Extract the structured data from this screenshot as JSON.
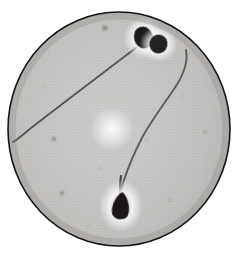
{
  "figure": {
    "kind": "photomicrograph",
    "caption": "",
    "medium": "halftone printed photomicrograph",
    "specimen": "spermatozoa smear",
    "field_shape": "circular microscope field of view",
    "background_color": "#ffffff"
  },
  "field": {
    "name": "microscope-field",
    "center_x": 119,
    "center_y": 129,
    "radius_x": 111,
    "radius_y": 117,
    "fill_color": "#c9c7c5",
    "rim_color": "#141414",
    "rim_width": 1.6,
    "texture": "fine halftone grid",
    "texture_color": "#9b9a98",
    "texture_pitch": 3
  },
  "illumination": {
    "name": "bright-spot-highlight",
    "x": 112,
    "y": 129,
    "radius": 22,
    "color": "#fdfdfd",
    "label": "condenser bright spot"
  },
  "vignette": {
    "name": "field-vignette",
    "inner_color": "#d4d2d0",
    "outer_color": "#a9a7a5"
  },
  "cells": [
    {
      "name": "sperm-upper-left",
      "label": "Spermatozoon A",
      "head": {
        "cx": 143.5,
        "cy": 37.5,
        "rx": 9.5,
        "ry": 11.0,
        "rotation": -18,
        "color": "#1d1b1a",
        "halo_color": "#f4f3f2",
        "shape": "oval"
      },
      "tail": {
        "path": "M 137 47 C 124 57, 96 78, 70 98 C 52 112, 36 124, 25 133 C 19 138, 15 141, 13 142",
        "color": "#585655",
        "width": 1.9,
        "direction": "down-left"
      }
    },
    {
      "name": "sperm-upper-right",
      "label": "Spermatozoon B",
      "head": {
        "cx": 158.5,
        "cy": 44.0,
        "rx": 9.0,
        "ry": 9.5,
        "rotation": 12,
        "color": "#232120",
        "halo_color": "#f4f3f2",
        "shape": "oval"
      },
      "tail": {
        "path": "M 186 50 C 188 60, 185 72, 176 86 C 167 100, 153 118, 143 136 C 134 153, 128 168, 124 180 C 122 186, 121 190, 120 194",
        "color": "#5d5b5a",
        "width": 1.9,
        "direction": "down-left"
      }
    },
    {
      "name": "sperm-lower-center",
      "label": "Spermatozoon C",
      "head": {
        "cx": 121.0,
        "cy": 206.0,
        "rx": 10.5,
        "ry": 14.0,
        "rotation": 6,
        "color": "#1a1817",
        "halo_color": "#fbfafa",
        "shape": "pear"
      },
      "tail": {
        "path": "M 120 192 C 120 188, 120 182, 121 176",
        "color": "#454342",
        "width": 2.2,
        "direction": "up"
      }
    }
  ],
  "debris": [
    {
      "name": "debris-speck-1",
      "cx": 105,
      "cy": 28,
      "r": 2.6,
      "color": "#76746f",
      "opacity": 0.75
    },
    {
      "name": "debris-speck-2",
      "cx": 54,
      "cy": 139,
      "r": 2.0,
      "color": "#6f6d69",
      "opacity": 0.72
    },
    {
      "name": "debris-speck-3",
      "cx": 205,
      "cy": 132,
      "r": 1.7,
      "color": "#8b8985",
      "opacity": 0.55
    },
    {
      "name": "debris-speck-4",
      "cx": 62,
      "cy": 193,
      "r": 2.3,
      "color": "#7d7b77",
      "opacity": 0.62
    },
    {
      "name": "debris-speck-5",
      "cx": 147,
      "cy": 140,
      "r": 1.4,
      "color": "#97958f",
      "opacity": 0.5
    },
    {
      "name": "debris-speck-6",
      "cx": 100,
      "cy": 168,
      "r": 1.2,
      "color": "#96948e",
      "opacity": 0.45
    },
    {
      "name": "debris-speck-7",
      "cx": 183,
      "cy": 96,
      "r": 1.2,
      "color": "#9a9892",
      "opacity": 0.42
    },
    {
      "name": "debris-speck-8",
      "cx": 45,
      "cy": 86,
      "r": 1.3,
      "color": "#98968f",
      "opacity": 0.45
    },
    {
      "name": "debris-speck-9",
      "cx": 170,
      "cy": 200,
      "r": 1.5,
      "color": "#8f8d88",
      "opacity": 0.48
    },
    {
      "name": "debris-speck-10",
      "cx": 88,
      "cy": 226,
      "r": 1.3,
      "color": "#93918b",
      "opacity": 0.45
    }
  ]
}
